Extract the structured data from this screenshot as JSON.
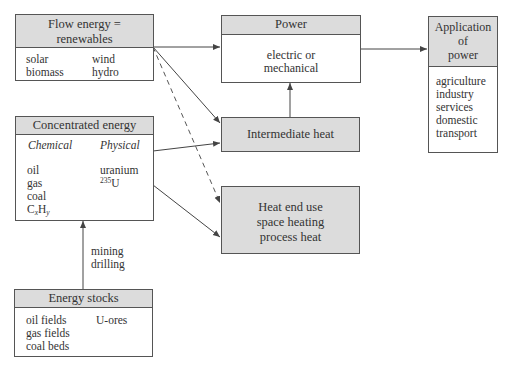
{
  "diagram": {
    "flow_energy": {
      "title_line1": "Flow energy =",
      "title_line2": "renewables",
      "col1": [
        "solar",
        "biomass"
      ],
      "col2": [
        "wind",
        "hydro"
      ]
    },
    "concentrated_energy": {
      "title": "Concentrated energy",
      "chemical_heading": "Chemical",
      "physical_heading": "Physical",
      "chemical_items": [
        "oil",
        "gas",
        "coal"
      ],
      "chemical_formula": {
        "base1": "C",
        "sub1": "x",
        "base2": "H",
        "sub2": "y"
      },
      "physical_items": [
        "uranium"
      ],
      "isotope": {
        "sup": "235",
        "symbol": "U"
      }
    },
    "energy_stocks": {
      "title": "Energy stocks",
      "col1": [
        "oil fields",
        "gas fields",
        "coal beds"
      ],
      "col2": [
        "U-ores"
      ]
    },
    "extraction_label": {
      "line1": "mining",
      "line2": "drilling"
    },
    "power": {
      "title": "Power",
      "body_line1": "electric or",
      "body_line2": "mechanical"
    },
    "intermediate_heat": {
      "title": "Intermediate heat"
    },
    "heat_end_use": {
      "line1": "Heat end use",
      "line2": "space heating",
      "line3": "process heat"
    },
    "application": {
      "title_line1": "Application",
      "title_line2": "of",
      "title_line3": "power",
      "items": [
        "agriculture",
        "industry",
        "services",
        "domestic",
        "transport"
      ]
    },
    "colors": {
      "header_fill": "#dcdcdc",
      "border": "#555555",
      "arrow": "#444444"
    }
  }
}
